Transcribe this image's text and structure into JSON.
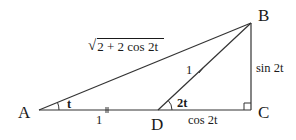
{
  "diagram": {
    "type": "geometry",
    "colors": {
      "stroke": "#333333",
      "text": "#1a1a1a",
      "background": "#ffffff"
    },
    "vertices": {
      "A": {
        "label": "A",
        "x": 39,
        "y": 110
      },
      "B": {
        "label": "B",
        "x": 251,
        "y": 23
      },
      "C": {
        "label": "C",
        "x": 251,
        "y": 110
      },
      "D": {
        "label": "D",
        "x": 158,
        "y": 110
      }
    },
    "segments": [
      {
        "from": "A",
        "to": "B",
        "label": "√(2 + 2 cos 2t)"
      },
      {
        "from": "A",
        "to": "D",
        "label": "1",
        "tick": "double"
      },
      {
        "from": "D",
        "to": "B",
        "label": "1",
        "tick": "single"
      },
      {
        "from": "D",
        "to": "C",
        "label": "cos 2t"
      },
      {
        "from": "C",
        "to": "B",
        "label": "sin 2t"
      }
    ],
    "angles": [
      {
        "at": "A",
        "label": "t"
      },
      {
        "at": "D",
        "label": "2t"
      },
      {
        "at": "C",
        "label": "right-angle"
      }
    ],
    "labels": {
      "A": "A",
      "B": "B",
      "C": "C",
      "D": "D",
      "ab_sqrt_body": "2 + 2 cos 2t",
      "ab_sqrt_sign": "√",
      "ad": "1",
      "db": "1",
      "dc": "cos 2t",
      "cb": "sin 2t",
      "angle_a": "t",
      "angle_d": "2t"
    }
  }
}
